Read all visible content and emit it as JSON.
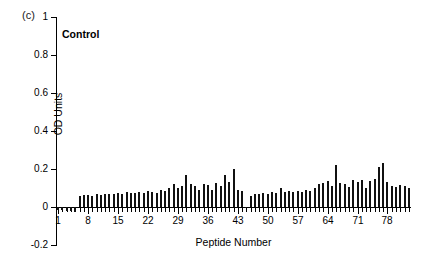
{
  "figure": {
    "panel_label": "(c)",
    "title": "Control"
  },
  "axes": {
    "y_title": "OD Units",
    "x_title": "Peptide Number",
    "y_tick_labels": [
      "1",
      "0.8",
      "0.6",
      "0.4",
      "0.2",
      "0",
      "-0.2"
    ],
    "x_tick_labels": [
      "1",
      "8",
      "15",
      "22",
      "29",
      "36",
      "43",
      "50",
      "57",
      "64",
      "71",
      "78"
    ]
  },
  "chart_data": {
    "type": "bar",
    "title": "Control",
    "panel": "(c)",
    "xlabel": "Peptide Number",
    "ylabel": "OD Units",
    "ylim": [
      -0.2,
      1
    ],
    "ytick_values": [
      1,
      0.8,
      0.6,
      0.4,
      0.2,
      0,
      -0.2
    ],
    "xlim": [
      0.5,
      83.5
    ],
    "xtick_values": [
      1,
      8,
      15,
      22,
      29,
      36,
      43,
      50,
      57,
      64,
      71,
      78
    ],
    "grid": false,
    "legend": null,
    "bar_color": "#111111",
    "categories": [
      1,
      2,
      3,
      4,
      5,
      6,
      7,
      8,
      9,
      10,
      11,
      12,
      13,
      14,
      15,
      16,
      17,
      18,
      19,
      20,
      21,
      22,
      23,
      24,
      25,
      26,
      27,
      28,
      29,
      30,
      31,
      32,
      33,
      34,
      35,
      36,
      37,
      38,
      39,
      40,
      41,
      42,
      43,
      44,
      45,
      46,
      47,
      48,
      49,
      50,
      51,
      52,
      53,
      54,
      55,
      56,
      57,
      58,
      59,
      60,
      61,
      62,
      63,
      64,
      65,
      66,
      67,
      68,
      69,
      70,
      71,
      72,
      73,
      74,
      75,
      76,
      77,
      78,
      79,
      80,
      81,
      82,
      83
    ],
    "values": [
      -0.018,
      -0.016,
      -0.02,
      -0.022,
      -0.024,
      0.06,
      0.062,
      0.064,
      0.058,
      0.07,
      0.062,
      0.07,
      0.068,
      0.066,
      0.072,
      0.07,
      0.08,
      0.072,
      0.074,
      0.078,
      0.076,
      0.082,
      0.08,
      0.074,
      0.09,
      0.084,
      0.1,
      0.12,
      0.1,
      0.11,
      0.17,
      0.12,
      0.11,
      0.09,
      0.12,
      0.118,
      0.09,
      0.125,
      0.11,
      0.17,
      0.13,
      0.2,
      0.09,
      0.085,
      0.002,
      0.06,
      0.07,
      0.068,
      0.072,
      0.07,
      0.078,
      0.075,
      0.1,
      0.08,
      0.082,
      0.078,
      0.085,
      0.08,
      0.09,
      0.082,
      0.1,
      0.12,
      0.125,
      0.135,
      0.11,
      0.22,
      0.125,
      0.12,
      0.105,
      0.14,
      0.13,
      0.14,
      0.1,
      0.135,
      0.145,
      0.21,
      0.23,
      0.13,
      0.11,
      0.105,
      0.118,
      0.112,
      0.1
    ]
  }
}
